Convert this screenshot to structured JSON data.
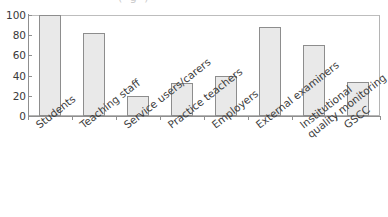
{
  "chart_data": {
    "type": "bar",
    "title": "",
    "xlabel": "",
    "ylabel": "",
    "ylim": [
      0,
      100
    ],
    "yticks": [
      0,
      20,
      40,
      60,
      80,
      100
    ],
    "grid": false,
    "legend": "none",
    "categories": [
      "Students",
      "Teaching staff",
      "Service users/carers",
      "Practice teachers",
      "Employers",
      "External examiners",
      "Institutional quality monitoring",
      "GSCC"
    ],
    "category_lines": [
      [
        "Students"
      ],
      [
        "Teaching staff"
      ],
      [
        "Service users/carers"
      ],
      [
        "Practice teachers"
      ],
      [
        "Employers"
      ],
      [
        "External examiners"
      ],
      [
        "Institutional",
        "quality monitoring"
      ],
      [
        "GSCC"
      ]
    ],
    "values": [
      100,
      82,
      20,
      33,
      40,
      88,
      70,
      34
    ],
    "series": [
      {
        "name": "",
        "values": [
          100,
          82,
          20,
          33,
          40,
          88,
          70,
          34
        ]
      }
    ],
    "colors": {
      "bar_fill": "#e9e9e9",
      "bar_stroke": "#8d8d8d",
      "axis": "#8f8f8f",
      "frame": "#b4b4b4",
      "text": "#3d3d3d",
      "background": "#ffffff"
    }
  },
  "title_remnant": "( g )",
  "ytick_labels": [
    "0",
    "20",
    "40",
    "60",
    "80",
    "100"
  ]
}
